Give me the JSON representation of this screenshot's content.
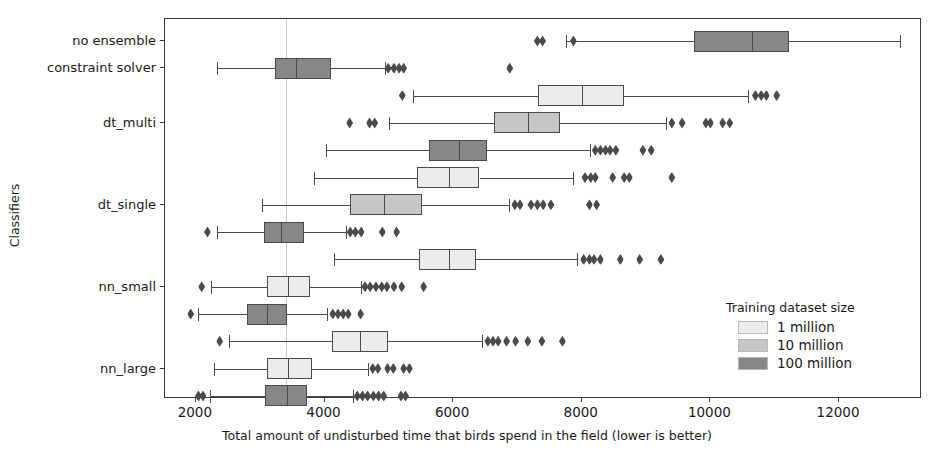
{
  "chart_data": {
    "type": "box",
    "title": "",
    "xlabel": "Total amount of undisturbed time that birds spend in the field (lower is better)",
    "ylabel": "Classifiers",
    "xlim": [
      1520,
      13290
    ],
    "xticks": [
      2000,
      4000,
      6000,
      8000,
      10000,
      12000
    ],
    "xtick_labels": [
      "2000",
      "4000",
      "6000",
      "8000",
      "10000",
      "12000"
    ],
    "grid": "vertical-at-3400",
    "gridline_x": 3400,
    "categories": [
      "no ensemble",
      "constraint solver",
      "dt_multi",
      "dt_single",
      "nn_small",
      "nn_large"
    ],
    "legend": {
      "title": "Training dataset size",
      "position": "lower-right",
      "entries": [
        {
          "label": "1 million",
          "color": "#ececec"
        },
        {
          "label": "10 million",
          "color": "#c6c6c6"
        },
        {
          "label": "100 million",
          "color": "#878787"
        }
      ]
    },
    "orientation": "horizontal",
    "boxes": [
      {
        "group": "no ensemble",
        "series": "100 million",
        "color": "#878787",
        "row": 0,
        "whisker_low": 7760,
        "q1": 9740,
        "median": 10640,
        "q3": 11220,
        "whisker_high": 12950,
        "outliers": [
          7310,
          7390,
          7870
        ]
      },
      {
        "group": "constraint solver",
        "series": "100 million",
        "color": "#878787",
        "row": 1,
        "whisker_low": 2330,
        "q1": 3230,
        "median": 3560,
        "q3": 4100,
        "whisker_high": 4940,
        "outliers": [
          4990,
          5080,
          5160,
          5230,
          6880
        ]
      },
      {
        "group": "dt_multi",
        "series": "1 million",
        "color": "#ececec",
        "row": 2,
        "whisker_low": 5380,
        "q1": 7320,
        "median": 8010,
        "q3": 8650,
        "whisker_high": 10590,
        "outliers": [
          5210,
          10700,
          10790,
          10870,
          11030
        ]
      },
      {
        "group": "dt_multi",
        "series": "10 million",
        "color": "#c6c6c6",
        "row": 3,
        "whisker_low": 5010,
        "q1": 6630,
        "median": 7160,
        "q3": 7660,
        "whisker_high": 9310,
        "outliers": [
          4390,
          4700,
          4780,
          9400,
          9560,
          9930,
          10000,
          10190,
          10300
        ]
      },
      {
        "group": "dt_multi",
        "series": "100 million",
        "color": "#878787",
        "row": 4,
        "whisker_low": 4030,
        "q1": 5630,
        "median": 6090,
        "q3": 6530,
        "whisker_high": 8130,
        "outliers": [
          8210,
          8290,
          8370,
          8440,
          8530,
          8950,
          9080
        ]
      },
      {
        "group": "dt_single",
        "series": "1 million",
        "color": "#ececec",
        "row": 5,
        "whisker_low": 3840,
        "q1": 5440,
        "median": 5930,
        "q3": 6410,
        "whisker_high": 7870,
        "outliers": [
          8050,
          8140,
          8210,
          8480,
          8660,
          8740,
          9400
        ]
      },
      {
        "group": "dt_single",
        "series": "10 million",
        "color": "#c6c6c6",
        "row": 6,
        "whisker_low": 3030,
        "q1": 4400,
        "median": 4930,
        "q3": 5520,
        "whisker_high": 6870,
        "outliers": [
          6960,
          7040,
          7210,
          7310,
          7400,
          7520,
          8120,
          8230
        ]
      },
      {
        "group": "dt_single",
        "series": "100 million",
        "color": "#878787",
        "row": 7,
        "whisker_low": 2330,
        "q1": 3060,
        "median": 3320,
        "q3": 3680,
        "whisker_high": 4330,
        "outliers": [
          2180,
          4400,
          4480,
          4570,
          4900,
          5120
        ]
      },
      {
        "group": "nn_small",
        "series": "1 million",
        "color": "#ececec",
        "row": 8,
        "whisker_low": 4150,
        "q1": 5470,
        "median": 5940,
        "q3": 6360,
        "whisker_high": 7930,
        "outliers": [
          8030,
          8120,
          8190,
          8290,
          8600,
          8900,
          9230
        ]
      },
      {
        "group": "nn_small",
        "series": "1 million",
        "color": "#ececec",
        "row": 9,
        "whisker_low": 2240,
        "q1": 3110,
        "median": 3440,
        "q3": 3780,
        "whisker_high": 4560,
        "outliers": [
          2090,
          4630,
          4710,
          4800,
          4890,
          4970,
          5080,
          5200,
          5540
        ]
      },
      {
        "group": "nn_small",
        "series": "100 million",
        "color": "#878787",
        "row": 10,
        "whisker_low": 2040,
        "q1": 2790,
        "median": 3100,
        "q3": 3420,
        "whisker_high": 4040,
        "outliers": [
          1920,
          4130,
          4210,
          4290,
          4370,
          4560
        ]
      },
      {
        "group": "nn_large",
        "series": "1 million",
        "color": "#ececec",
        "row": 11,
        "whisker_low": 2520,
        "q1": 4110,
        "median": 4550,
        "q3": 4990,
        "whisker_high": 6450,
        "outliers": [
          2370,
          6540,
          6620,
          6700,
          6830,
          6970,
          7160,
          7380,
          7700
        ]
      },
      {
        "group": "nn_large",
        "series": "10 million",
        "color": "#ececec",
        "row": 12,
        "whisker_low": 2280,
        "q1": 3100,
        "median": 3430,
        "q3": 3800,
        "whisker_high": 4670,
        "outliers": [
          4750,
          4830,
          4980,
          5070,
          5230,
          5320
        ]
      },
      {
        "group": "nn_large",
        "series": "100 million",
        "color": "#878787",
        "row": 13,
        "whisker_low": 2220,
        "q1": 3080,
        "median": 3420,
        "q3": 3730,
        "whisker_high": 4440,
        "outliers": [
          2040,
          2110,
          4510,
          4590,
          4670,
          4760,
          4840,
          4920,
          5190,
          5260
        ]
      }
    ]
  }
}
